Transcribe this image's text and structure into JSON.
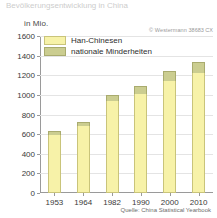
{
  "title": "Bevölkerungsentwicklung in China",
  "unit_label": "in Mio.",
  "copyright": "© Westermann",
  "copyright_code": "38683 CX",
  "source": "Quelle: China Statistical Yearbook",
  "legend": {
    "items": [
      {
        "label": "Han-Chinesen",
        "color": "#f7f2a8",
        "key": "han"
      },
      {
        "label": "nationale Minderheiten",
        "color": "#cbcd90",
        "key": "min"
      }
    ]
  },
  "chart_data": {
    "type": "bar",
    "stacked": true,
    "title": "Bevölkerungsentwicklung in China",
    "xlabel": "",
    "ylabel": "in Mio.",
    "ylim": [
      0,
      1600
    ],
    "ytick_step": 200,
    "yticks": [
      0,
      200,
      400,
      600,
      800,
      1000,
      1200,
      1400,
      1600
    ],
    "ytick_labels": [
      "0",
      "200",
      "400",
      "600",
      "800",
      "1000",
      "1200",
      "1400",
      "1600"
    ],
    "grid": true,
    "legend_position": "top-left",
    "categories": [
      "1953",
      "1964",
      "1982",
      "1990",
      "2000",
      "2010"
    ],
    "series": [
      {
        "name": "Han-Chinesen",
        "color": "#f7f2a8",
        "values": [
          594,
          680,
          937,
          1004,
          1137,
          1226
        ]
      },
      {
        "name": "nationale Minderheiten",
        "color": "#cbcd90",
        "values": [
          40,
          45,
          67,
          91,
          106,
          114
        ]
      }
    ],
    "totals": [
      634,
      725,
      1004,
      1095,
      1243,
      1340
    ],
    "source": "Quelle: China Statistical Yearbook"
  }
}
